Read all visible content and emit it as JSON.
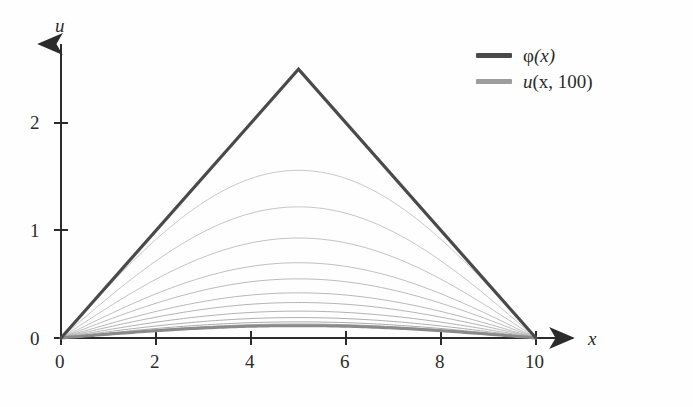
{
  "chart_data": {
    "type": "line",
    "title": "",
    "xlabel": "x",
    "ylabel": "u",
    "xlim": [
      0,
      10
    ],
    "ylim": [
      0,
      2.6
    ],
    "grid": false,
    "legend_position": "top-right",
    "x_ticks": [
      0,
      2,
      4,
      6,
      8,
      10
    ],
    "x_tick_labels": [
      "0",
      "2",
      "4",
      "6",
      "8",
      "10"
    ],
    "y_ticks": [
      0,
      1,
      2
    ],
    "y_tick_labels": [
      "0",
      "1",
      "2"
    ],
    "axis_arrows": true,
    "annotations": [],
    "series": [
      {
        "name": "φ(x)",
        "role": "initial-condition",
        "color": "#4a4a4a",
        "width": 3.2,
        "shape": "triangular-tent",
        "x": [
          0,
          5,
          10
        ],
        "values": [
          0,
          2.5,
          0
        ]
      },
      {
        "name": "u(x, t) family",
        "role": "decaying-solutions",
        "color": "#9d9d9d",
        "width": 1.0,
        "shape": "sine-arch",
        "x": [
          0,
          1,
          2,
          3,
          4,
          5,
          6,
          7,
          8,
          9,
          10
        ],
        "peaks": [
          1.56,
          1.22,
          0.93,
          0.7,
          0.55,
          0.42,
          0.33,
          0.25,
          0.19,
          0.15,
          0.13
        ]
      },
      {
        "name": "u(x, 100)",
        "role": "final-solution",
        "color": "#8a8a8a",
        "width": 3.0,
        "shape": "sine-arch",
        "x": [
          0,
          1,
          2,
          3,
          4,
          5,
          6,
          7,
          8,
          9,
          10
        ],
        "peak": 0.115,
        "values": [
          0,
          0.036,
          0.068,
          0.093,
          0.109,
          0.115,
          0.109,
          0.093,
          0.068,
          0.036,
          0
        ]
      }
    ]
  },
  "legend": {
    "entries": [
      {
        "label": "φ(x)",
        "symbol": "φ",
        "arg": "(x)",
        "color": "#4a4a4a"
      },
      {
        "label": "u(x, 100)",
        "symbol": "u",
        "arg": "(x, 100)",
        "color": "#9d9d9d"
      }
    ]
  },
  "axes": {
    "x_name": "x",
    "y_name": "u",
    "x_tick_labels": [
      "0",
      "2",
      "4",
      "6",
      "8",
      "10"
    ],
    "y_tick_labels": [
      "0",
      "1",
      "2"
    ],
    "axis_color": "#2b2b2b"
  },
  "colors": {
    "background": "#fefefe",
    "axis": "#2b2b2b",
    "phi_curve": "#4a4a4a",
    "family_curve": "#9d9d9d",
    "final_curve": "#8a8a8a",
    "text": "#2b2b2b"
  }
}
